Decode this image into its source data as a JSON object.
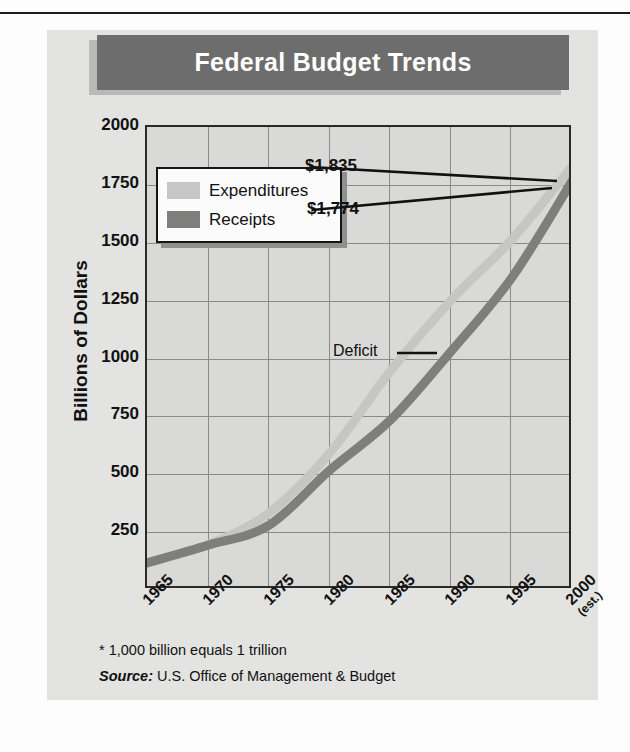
{
  "figure": {
    "title": "Federal Budget Trends",
    "footnote": "* 1,000 billion equals 1 trillion",
    "source_label": "Source:",
    "source_text": "U.S. Office of Management & Budget"
  },
  "colors": {
    "banner_bg": "#6d6d6d",
    "banner_text": "#ffffff",
    "panel_bg": "#e3e3e1",
    "plot_bg": "#d9d9d7",
    "gridline": "#8a8a8a",
    "axis": "#2a2a2a",
    "expenditures": "#c6c6c4",
    "receipts": "#7e7e7c",
    "leader_line": "#111111"
  },
  "legend": {
    "position": "inside-upper-left",
    "items": [
      {
        "label": "Expenditures",
        "color": "#c6c6c4",
        "swatch": "light-gray-swatch"
      },
      {
        "label": "Receipts",
        "color": "#7e7e7c",
        "swatch": "dark-gray-swatch"
      }
    ]
  },
  "annotations": [
    {
      "name": "expenditures-value",
      "text": "$1,835"
    },
    {
      "name": "receipts-value",
      "text": "$1,774"
    },
    {
      "name": "deficit-callout",
      "text": "Deficit"
    }
  ],
  "chart_data": {
    "type": "area",
    "title": "Federal Budget Trends",
    "xlabel": "",
    "ylabel": "Billions of Dollars",
    "xlim": [
      1965,
      2000
    ],
    "ylim": [
      0,
      2000
    ],
    "ytick_labels": [
      "2000",
      "1750",
      "1500",
      "1250",
      "1000",
      "750",
      "500",
      "250"
    ],
    "ytick_values": [
      2000,
      1750,
      1500,
      1250,
      1000,
      750,
      500,
      250
    ],
    "xtick_labels": [
      "1965",
      "1970",
      "1975",
      "1980",
      "1985",
      "1990",
      "1995",
      "2000"
    ],
    "xtick_sublabels": [
      "",
      "",
      "",
      "",
      "",
      "",
      "",
      "(est.)"
    ],
    "xtick_values": [
      1965,
      1970,
      1975,
      1980,
      1985,
      1990,
      1995,
      2000
    ],
    "grid": true,
    "legend_position": "upper left inside",
    "x": [
      1965,
      1970,
      1975,
      1980,
      1985,
      1990,
      1995,
      2000
    ],
    "series": [
      {
        "name": "Expenditures",
        "color": "#c6c6c4",
        "values": [
          118,
          196,
          332,
          591,
          946,
          1253,
          1516,
          1835
        ],
        "end_label": "$1,835"
      },
      {
        "name": "Receipts",
        "color": "#7e7e7c",
        "values": [
          117,
          193,
          279,
          517,
          734,
          1032,
          1351,
          1774
        ],
        "end_label": "$1,774"
      }
    ],
    "band_label": "Deficit",
    "band_description": "Gap between Expenditures and Receipts"
  },
  "axes": {
    "y_title": "Billions of Dollars"
  }
}
